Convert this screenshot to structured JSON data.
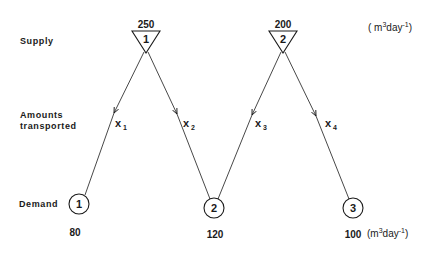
{
  "labels": {
    "supply": "Supply",
    "amounts_line1": "Amounts",
    "amounts_line2": "transported",
    "demand": "Demand"
  },
  "units": {
    "top_open": "( m",
    "top_sup3": "3",
    "top_mid": "day",
    "top_supneg": "-1",
    "top_close": ")",
    "bottom_open": "(m",
    "bottom_sup3": "3",
    "bottom_mid": "day",
    "bottom_supneg": "-1",
    "bottom_close": ")"
  },
  "supply_nodes": [
    {
      "id": "1",
      "amount": "250"
    },
    {
      "id": "2",
      "amount": "200"
    }
  ],
  "demand_nodes": [
    {
      "id": "1",
      "amount": "80"
    },
    {
      "id": "2",
      "amount": "120"
    },
    {
      "id": "3",
      "amount": "100"
    }
  ],
  "edges": [
    {
      "var": "x",
      "sub": "1",
      "from": "supply-1",
      "to": "demand-1"
    },
    {
      "var": "x",
      "sub": "2",
      "from": "supply-1",
      "to": "demand-2"
    },
    {
      "var": "x",
      "sub": "3",
      "from": "supply-2",
      "to": "demand-2"
    },
    {
      "var": "x",
      "sub": "4",
      "from": "supply-2",
      "to": "demand-3"
    }
  ]
}
